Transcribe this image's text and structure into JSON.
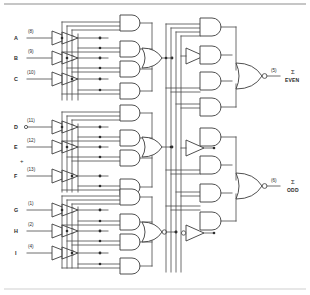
{
  "figure": {
    "kind": "logic-schematic",
    "top_rule": true,
    "bottom_rule": true
  },
  "inputs": [
    {
      "name": "A",
      "pin": "(8)",
      "group": 1,
      "y": 38
    },
    {
      "name": "B",
      "pin": "(9)",
      "group": 1,
      "y": 58
    },
    {
      "name": "C",
      "pin": "(10)",
      "group": 1,
      "y": 79
    },
    {
      "name": "D",
      "pin": "(11)",
      "group": 2,
      "y": 127
    },
    {
      "name": "E",
      "pin": "(12)",
      "group": 2,
      "y": 147
    },
    {
      "name": "F",
      "pin": "(13)",
      "group": 2,
      "y": 176
    },
    {
      "name": "G",
      "pin": "(1)",
      "group": 3,
      "y": 210
    },
    {
      "name": "H",
      "pin": "(2)",
      "group": 3,
      "y": 231
    },
    {
      "name": "I",
      "pin": "(4)",
      "group": 3,
      "y": 253
    }
  ],
  "separator": {
    "symbol": "+",
    "x": 22,
    "y": 160
  },
  "outputs": [
    {
      "label": "EVEN",
      "sigma": "Σ",
      "pin": "(5)",
      "y": 76
    },
    {
      "label": "ODD",
      "sigma": "Σ",
      "pin": "(6)",
      "y": 186
    }
  ],
  "colors": {
    "wire": "#4a4a4a",
    "gate_outline": "#3c3c3c",
    "gate_fill": "#ffffff",
    "text": "#2b2b2b",
    "background": "#ffffff",
    "rule": "#8d8d8d"
  },
  "gate_counts": {
    "input_inverters": 9,
    "internal_inverters": 3,
    "and_gates": 12,
    "or_gates": 3,
    "output_nor_gates": 2
  }
}
